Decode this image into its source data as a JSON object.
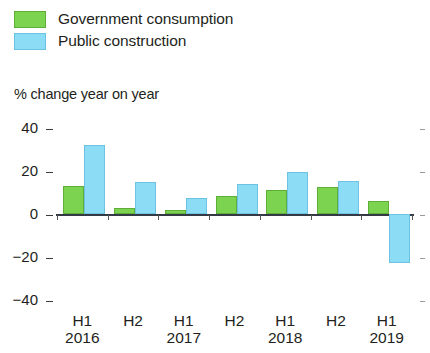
{
  "legend": {
    "items": [
      {
        "label": "Government consumption",
        "color": "#7cd34f",
        "swatch": "green-swatch"
      },
      {
        "label": "Public construction",
        "color": "#8ddcf5",
        "swatch": "blue-swatch"
      }
    ]
  },
  "axis_title": "% change year on year",
  "chart_data": {
    "type": "bar",
    "title": "",
    "subtitle": "",
    "xlabel": "",
    "ylabel": "% change year on year",
    "ylim": [
      -40,
      40
    ],
    "yticks": [
      40,
      20,
      0,
      -20,
      -40
    ],
    "ytick_labels": [
      "40",
      "20",
      "0",
      "−20",
      "−40"
    ],
    "grid": false,
    "legend_position": "top-left",
    "categories": [
      "H1",
      "H2",
      "H1",
      "H2",
      "H1",
      "H2",
      "H1"
    ],
    "category_years": [
      "2016",
      "",
      "2017",
      "",
      "2018",
      "",
      "2019"
    ],
    "series": [
      {
        "name": "Government consumption",
        "color": "#7cd34f",
        "values": [
          13,
          3,
          2,
          8.5,
          11,
          12.5,
          6
        ]
      },
      {
        "name": "Public construction",
        "color": "#8ddcf5",
        "values": [
          32,
          15,
          7.5,
          14,
          19.5,
          15.5,
          -23
        ]
      }
    ]
  }
}
